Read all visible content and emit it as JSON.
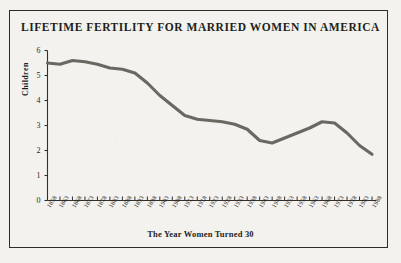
{
  "figure": {
    "title": "LIFETIME FERTILITY FOR MARRIED WOMEN IN AMERICA",
    "background_color": "#f3f2ee",
    "frame_color": "#2e2c28",
    "ink_color": "#6b6862"
  },
  "chart_data": {
    "type": "line",
    "title": "LIFETIME FERTILITY FOR MARRIED WOMEN IN AMERICA",
    "xlabel": "The Year Women Turned 30",
    "ylabel": "Children",
    "ylim": [
      0,
      6
    ],
    "yticks": [
      0,
      1,
      2,
      3,
      4,
      5,
      6
    ],
    "ytick_labels": [
      "0",
      "1",
      "2",
      "3",
      "4",
      "5",
      "6"
    ],
    "grid": false,
    "legend": "none",
    "x": [
      1858,
      1863,
      1868,
      1873,
      1878,
      1883,
      1888,
      1893,
      1898,
      1903,
      1908,
      1913,
      1918,
      1923,
      1928,
      1933,
      1938,
      1943,
      1948,
      1953,
      1958,
      1963,
      1968,
      1973,
      1978,
      1983,
      1988
    ],
    "xtick_labels": [
      "1858",
      "1863",
      "1868",
      "1873",
      "1878",
      "1883",
      "1888",
      "1893",
      "1898",
      "1903",
      "1908",
      "1913",
      "1918",
      "1923",
      "1928",
      "1933",
      "1938",
      "1943",
      "1948",
      "1953",
      "1958",
      "1963",
      "1968",
      "1973",
      "1978",
      "1983",
      "1988"
    ],
    "series": [
      {
        "name": "Lifetime fertility",
        "color": "#6b6862",
        "values": [
          5.5,
          5.45,
          5.6,
          5.55,
          5.45,
          5.3,
          5.25,
          5.1,
          4.7,
          4.2,
          3.8,
          3.4,
          3.25,
          3.2,
          3.15,
          3.05,
          2.85,
          2.4,
          2.3,
          2.5,
          2.7,
          2.9,
          3.15,
          3.1,
          2.7,
          2.2,
          1.85
        ]
      }
    ]
  }
}
